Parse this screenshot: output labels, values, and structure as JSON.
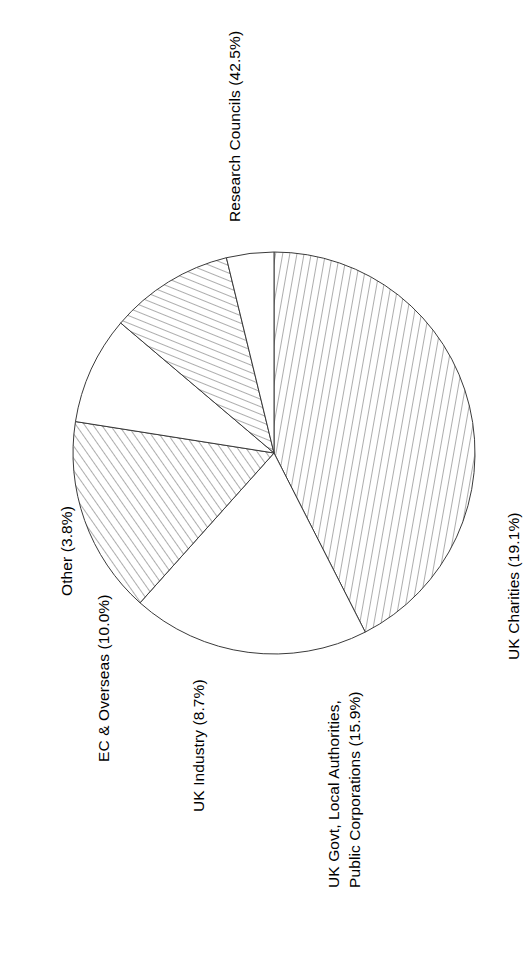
{
  "figure": {
    "kind": "pie-chart-figure",
    "orientation": "rotated-90-ccw",
    "background_color": "#ffffff",
    "stroke_color": "#3a3a3a",
    "text_color": "#000000"
  },
  "chart_data": {
    "type": "pie",
    "title": "",
    "legend_position": "none",
    "labels_placement": "outside-around-perimeter",
    "categories": [
      "Research Councils",
      "UK Charities",
      "UK Govt, Local Authorities, Public Corporations",
      "UK Industry",
      "EC & Overseas",
      "Other"
    ],
    "values": [
      42.5,
      19.1,
      15.9,
      8.7,
      10.0,
      3.8
    ],
    "value_unit": "%",
    "slice_labels": [
      "Research Councils (42.5%)",
      "UK Charities (19.1%)",
      "UK Govt, Local Authorities,",
      "Public Corporations (15.9%)",
      "UK Industry (8.7%)",
      "EC & Overseas (10.0%)",
      "Other (3.8%)"
    ],
    "slices": [
      {
        "name": "Research Councils",
        "label": "Research Councils (42.5%)",
        "value": 42.5,
        "fill": "hatch-vertical-steep",
        "hatch_angle_deg": 80,
        "start_angle_deg": 0.0,
        "end_angle_deg": 153.0
      },
      {
        "name": "UK Charities",
        "label": "UK Charities (19.1%)",
        "value": 19.1,
        "fill": "white",
        "hatch_angle_deg": null,
        "start_angle_deg": 153.0,
        "end_angle_deg": 221.8
      },
      {
        "name": "UK Govt, Local Authorities, Public Corporations",
        "label_line_1": "UK Govt, Local Authorities,",
        "label_line_2": "Public Corporations (15.9%)",
        "value": 15.9,
        "fill": "hatch-diagonal",
        "hatch_angle_deg": 55,
        "start_angle_deg": 221.8,
        "end_angle_deg": 279.0
      },
      {
        "name": "UK Industry",
        "label": "UK Industry (8.7%)",
        "value": 8.7,
        "fill": "white",
        "hatch_angle_deg": null,
        "start_angle_deg": 279.0,
        "end_angle_deg": 310.3
      },
      {
        "name": "EC & Overseas",
        "label": "EC & Overseas (10.0%)",
        "value": 10.0,
        "fill": "hatch-diagonal-shallow",
        "hatch_angle_deg": 25,
        "start_angle_deg": 310.3,
        "end_angle_deg": 346.3
      },
      {
        "name": "Other",
        "label": "Other (3.8%)",
        "value": 3.8,
        "fill": "white",
        "hatch_angle_deg": null,
        "start_angle_deg": 346.3,
        "end_angle_deg": 360.0
      }
    ],
    "geometry": {
      "center_x": 274,
      "center_y": 453,
      "radius": 201
    }
  },
  "labels": {
    "research_councils": "Research Councils (42.5%)",
    "uk_charities": "UK Charities (19.1%)",
    "uk_govt_line1": "UK Govt, Local Authorities,",
    "uk_govt_line2": "Public Corporations (15.9%)",
    "uk_industry": "UK Industry (8.7%)",
    "ec_overseas": "EC & Overseas (10.0%)",
    "other": "Other (3.8%)"
  }
}
